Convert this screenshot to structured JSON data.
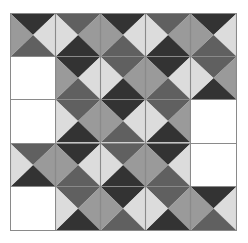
{
  "game": {
    "title": "Edge-matching tile puzzle",
    "rows": 5,
    "cols": 5,
    "colors": {
      "black": "#333333",
      "dark": "#606060",
      "medium": "#9a9a9a",
      "light": "#dcdcdc",
      "empty": "#ffffff",
      "gridline": "#8a8a8a"
    },
    "tile_types": {
      "A": {
        "top": "black",
        "right": "light",
        "bottom": "dark",
        "left": "medium"
      },
      "B": {
        "top": "dark",
        "right": "medium",
        "bottom": "black",
        "left": "light"
      }
    },
    "grid": [
      [
        "A",
        "B",
        "A",
        "B",
        "A"
      ],
      [
        null,
        "A",
        "B",
        "A",
        "B"
      ],
      [
        null,
        "B",
        "A",
        "B",
        null
      ],
      [
        "B",
        "A",
        "B",
        "A",
        null
      ],
      [
        null,
        "B",
        "A",
        "B",
        "A"
      ]
    ]
  }
}
